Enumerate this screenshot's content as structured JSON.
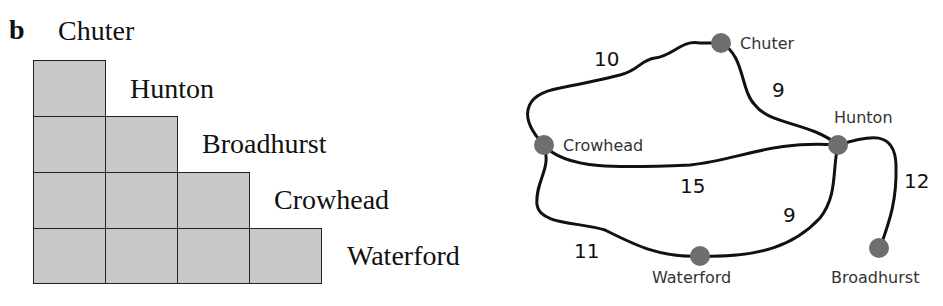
{
  "figure": {
    "part": "b",
    "table": {
      "towns": [
        "Chuter",
        "Hunton",
        "Broadhurst",
        "Crowhead",
        "Waterford"
      ],
      "cells": "blank"
    },
    "network": {
      "nodes": [
        {
          "id": "chuter",
          "label": "Chuter"
        },
        {
          "id": "crowhead",
          "label": "Crowhead"
        },
        {
          "id": "hunton",
          "label": "Hunton"
        },
        {
          "id": "waterford",
          "label": "Waterford"
        },
        {
          "id": "broadhurst",
          "label": "Broadhurst"
        }
      ],
      "edges": [
        {
          "from": "Crowhead",
          "to": "Chuter",
          "weight": "10"
        },
        {
          "from": "Chuter",
          "to": "Hunton",
          "weight": "9"
        },
        {
          "from": "Crowhead",
          "to": "Hunton",
          "weight": "15"
        },
        {
          "from": "Hunton",
          "to": "Broadhurst",
          "weight": "12"
        },
        {
          "from": "Crowhead",
          "to": "Waterford",
          "weight": "11"
        },
        {
          "from": "Waterford",
          "to": "Hunton",
          "weight": "9"
        }
      ],
      "node_color": "#6e6e6e",
      "edge_color": "#111111"
    }
  }
}
